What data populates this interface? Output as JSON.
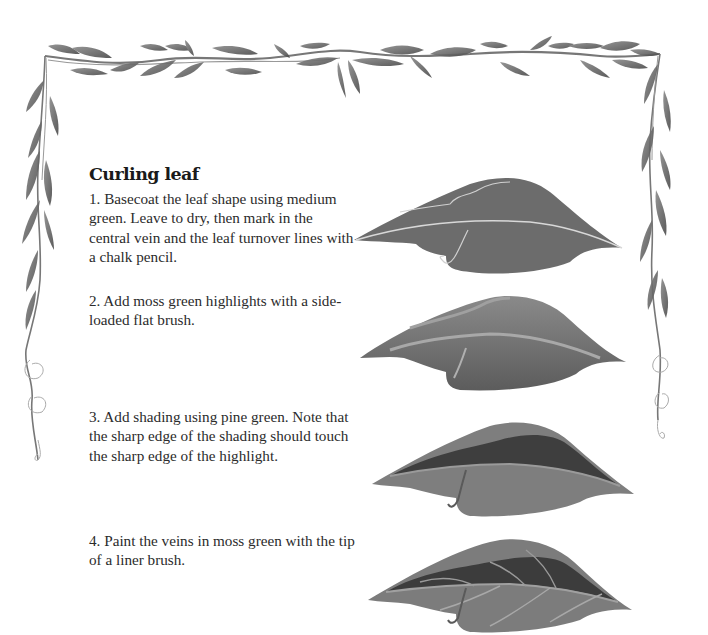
{
  "page": {
    "title": "Curling leaf",
    "steps": [
      {
        "number": "1",
        "text": "1. Basecoat the leaf shape using medium green. Leave to dry, then mark in the central vein and the leaf turnover lines with a chalk pencil."
      },
      {
        "number": "2",
        "text": "2. Add moss green highlights with a side-loaded flat brush."
      },
      {
        "number": "3",
        "text": "3. Add shading using pine green. Note that the sharp edge of the shading should touch the sharp edge of the highlight."
      },
      {
        "number": "4",
        "text": "4. Paint the veins in moss green with the tip of a liner brush."
      }
    ],
    "illustrations": [
      {
        "step": 1,
        "description": "leaf basecoat with chalk vein lines"
      },
      {
        "step": 2,
        "description": "leaf with moss green highlights"
      },
      {
        "step": 3,
        "description": "leaf with pine green shading"
      },
      {
        "step": 4,
        "description": "leaf with painted veins"
      }
    ],
    "colors": {
      "leaf_base": "#6b6b6b",
      "leaf_highlight": "#9a9a9a",
      "leaf_shadow": "#3c3c3c",
      "vine": "#707070",
      "text": "#2b2b2b"
    }
  }
}
